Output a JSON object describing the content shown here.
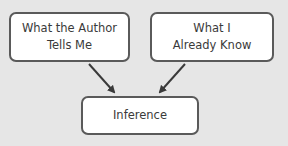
{
  "diagram": {
    "nodes": [
      {
        "id": "author",
        "line1": "What the Author",
        "line2": "Tells Me"
      },
      {
        "id": "know",
        "line1": "What I",
        "line2": "Already Know"
      },
      {
        "id": "inference",
        "label": "Inference"
      }
    ],
    "edges": [
      {
        "from": "author",
        "to": "inference"
      },
      {
        "from": "know",
        "to": "inference"
      }
    ],
    "colors": {
      "background": "#e6e6e6",
      "box_fill": "#ffffff",
      "border": "#5a5a5a",
      "arrow": "#3a3a3a"
    }
  }
}
